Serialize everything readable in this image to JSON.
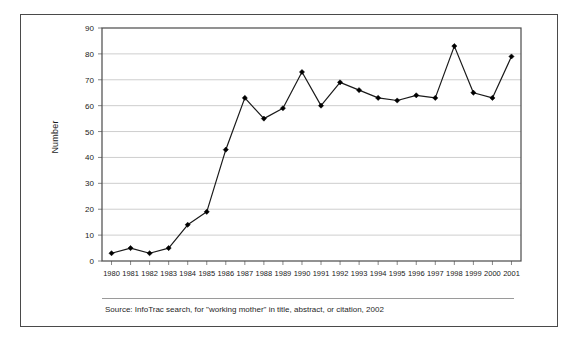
{
  "figure": {
    "caption": "Source: InfoTrac search, for \"working mother\" in title, abstract, or citation, 2002",
    "background_color": "#ffffff",
    "frame_color": "#4a4a4a"
  },
  "chart_data": {
    "type": "line",
    "title": "",
    "xlabel": "",
    "ylabel": "Number",
    "categories": [
      "1980",
      "1981",
      "1982",
      "1983",
      "1984",
      "1985",
      "1986",
      "1987",
      "1988",
      "1989",
      "1990",
      "1991",
      "1992",
      "1993",
      "1994",
      "1995",
      "1996",
      "1997",
      "1998",
      "1999",
      "2000",
      "2001"
    ],
    "values": [
      3,
      5,
      3,
      5,
      14,
      19,
      43,
      63,
      55,
      59,
      73,
      60,
      69,
      66,
      63,
      62,
      64,
      63,
      83,
      65,
      63,
      79
    ],
    "series": [
      {
        "name": "Number",
        "values": [
          3,
          5,
          3,
          5,
          14,
          19,
          43,
          63,
          55,
          59,
          73,
          60,
          69,
          66,
          63,
          62,
          64,
          63,
          83,
          65,
          63,
          79
        ]
      }
    ],
    "ylim": [
      0,
      90
    ],
    "yticks": [
      0,
      10,
      20,
      30,
      40,
      50,
      60,
      70,
      80,
      90
    ],
    "ytick_labels": [
      "0",
      "10",
      "20",
      "30",
      "40",
      "50",
      "60",
      "70",
      "80",
      "90"
    ],
    "grid": true,
    "grid_axis": "y",
    "grid_color": "#c8c8c8",
    "legend": "none",
    "line_color": "#1a1a1a",
    "marker": "diamond",
    "marker_color": "#000000"
  }
}
